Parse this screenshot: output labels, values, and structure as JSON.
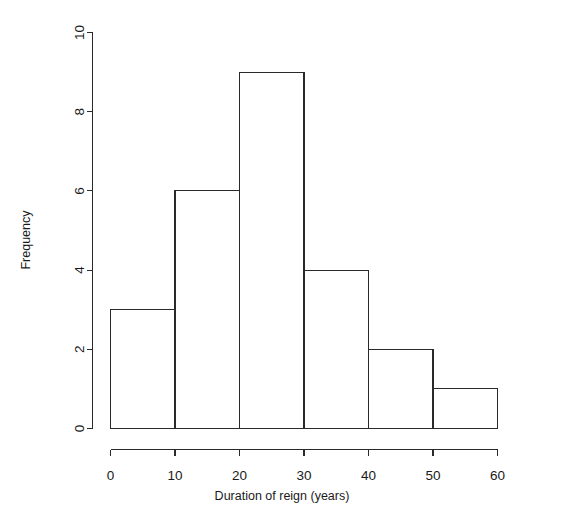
{
  "chart_data": {
    "type": "bar",
    "title": "",
    "subtitle": "",
    "xlabel": "Duration of reign (years)",
    "ylabel": "Frequency",
    "categories": [
      "0-10",
      "10-20",
      "20-30",
      "30-40",
      "40-50",
      "50-60"
    ],
    "bin_edges": [
      0,
      10,
      20,
      30,
      40,
      50,
      60
    ],
    "values": [
      3,
      6,
      9,
      4,
      2,
      1
    ],
    "xlim": [
      0,
      60
    ],
    "ylim": [
      0,
      10
    ],
    "xticks": [
      0,
      10,
      20,
      30,
      40,
      50,
      60
    ],
    "xtick_labels": [
      "0",
      "10",
      "20",
      "30",
      "40",
      "50",
      "60"
    ],
    "yticks": [
      0,
      2,
      4,
      6,
      8,
      10
    ],
    "ytick_labels": [
      "0",
      "2",
      "4",
      "6",
      "8",
      "10"
    ],
    "grid": false,
    "legend": false,
    "legend_position": "none",
    "bar_fill": "#ffffff",
    "bar_stroke": "#2a2a2a",
    "background": "#ffffff",
    "style": "r-base-histogram"
  },
  "axes": {
    "x_axis_name": "x-axis",
    "y_axis_name": "y-axis"
  }
}
